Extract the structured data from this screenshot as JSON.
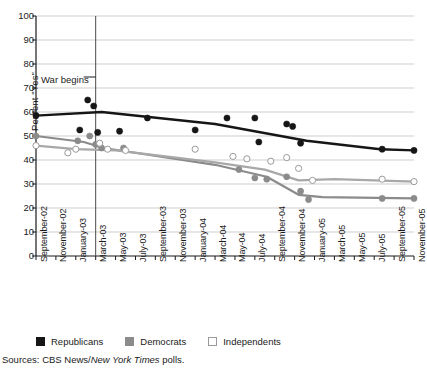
{
  "chart_data": {
    "type": "line",
    "title": "",
    "xlabel": "",
    "ylabel": "Percent \"Yes\"",
    "ylim": [
      0,
      100
    ],
    "yticks": [
      0,
      10,
      20,
      30,
      40,
      50,
      60,
      70,
      80,
      90,
      100
    ],
    "grid": true,
    "legend_position": "below-axis",
    "categories": [
      "September-02",
      "November-02",
      "January-03",
      "March-03",
      "May-03",
      "July-03",
      "September-03",
      "November-03",
      "January-04",
      "March-04",
      "May-04",
      "July-04",
      "September-04",
      "November-04",
      "January-05",
      "March-05",
      "May-05",
      "July-05",
      "September-05",
      "November-05"
    ],
    "annotations": [
      {
        "text": "War begins",
        "x_category": "March-03",
        "type": "vertical-rule"
      }
    ],
    "series": [
      {
        "name": "Republicans",
        "color": "#161616",
        "marker": "filled-circle",
        "trend": [
          {
            "x": 0.0,
            "y": 58.5
          },
          {
            "x": 3.3,
            "y": 60.0
          },
          {
            "x": 9.0,
            "y": 55.0
          },
          {
            "x": 13.6,
            "y": 48.0
          },
          {
            "x": 17.3,
            "y": 44.5
          },
          {
            "x": 19.0,
            "y": 44.0
          }
        ],
        "points": [
          {
            "x": 0.0,
            "y": 58.5
          },
          {
            "x": 2.6,
            "y": 65.0
          },
          {
            "x": 2.9,
            "y": 62.5
          },
          {
            "x": 2.2,
            "y": 52.5
          },
          {
            "x": 3.1,
            "y": 51.5
          },
          {
            "x": 4.2,
            "y": 52.0
          },
          {
            "x": 5.6,
            "y": 57.5
          },
          {
            "x": 8.0,
            "y": 52.5
          },
          {
            "x": 9.6,
            "y": 57.5
          },
          {
            "x": 11.0,
            "y": 57.5
          },
          {
            "x": 12.6,
            "y": 55.0
          },
          {
            "x": 12.9,
            "y": 54.0
          },
          {
            "x": 11.2,
            "y": 47.5
          },
          {
            "x": 13.3,
            "y": 47.0
          },
          {
            "x": 17.4,
            "y": 44.5
          },
          {
            "x": 19.0,
            "y": 44.0
          }
        ]
      },
      {
        "name": "Democrats",
        "color": "#8b8b8b",
        "marker": "filled-circle",
        "trend": [
          {
            "x": 0.0,
            "y": 50.0
          },
          {
            "x": 2.4,
            "y": 47.5
          },
          {
            "x": 3.4,
            "y": 45.0
          },
          {
            "x": 9.0,
            "y": 38.0
          },
          {
            "x": 11.6,
            "y": 33.0
          },
          {
            "x": 13.2,
            "y": 25.5
          },
          {
            "x": 14.4,
            "y": 24.5
          },
          {
            "x": 19.0,
            "y": 24.0
          }
        ],
        "points": [
          {
            "x": 0.0,
            "y": 50.0
          },
          {
            "x": 2.1,
            "y": 48.0
          },
          {
            "x": 2.7,
            "y": 50.0
          },
          {
            "x": 3.0,
            "y": 46.5
          },
          {
            "x": 3.3,
            "y": 45.0
          },
          {
            "x": 4.4,
            "y": 45.0
          },
          {
            "x": 10.2,
            "y": 36.0
          },
          {
            "x": 11.0,
            "y": 32.5
          },
          {
            "x": 11.6,
            "y": 32.0
          },
          {
            "x": 12.6,
            "y": 33.0
          },
          {
            "x": 13.3,
            "y": 27.0
          },
          {
            "x": 13.7,
            "y": 23.5
          },
          {
            "x": 17.4,
            "y": 24.0
          },
          {
            "x": 19.0,
            "y": 24.0
          }
        ]
      },
      {
        "name": "Independents",
        "color": "#ffffff",
        "stroke": "#9a9a9a",
        "marker": "open-circle",
        "trend": [
          {
            "x": 0.0,
            "y": 46.0
          },
          {
            "x": 2.0,
            "y": 44.5
          },
          {
            "x": 4.0,
            "y": 44.0
          },
          {
            "x": 9.0,
            "y": 39.0
          },
          {
            "x": 11.5,
            "y": 36.0
          },
          {
            "x": 13.2,
            "y": 31.5
          },
          {
            "x": 15.0,
            "y": 32.0
          },
          {
            "x": 19.0,
            "y": 31.0
          }
        ],
        "points": [
          {
            "x": 0.0,
            "y": 46.0
          },
          {
            "x": 1.6,
            "y": 43.0
          },
          {
            "x": 2.0,
            "y": 44.5
          },
          {
            "x": 3.2,
            "y": 47.0
          },
          {
            "x": 3.6,
            "y": 44.5
          },
          {
            "x": 4.5,
            "y": 44.0
          },
          {
            "x": 8.0,
            "y": 44.5
          },
          {
            "x": 9.9,
            "y": 41.5
          },
          {
            "x": 10.6,
            "y": 40.5
          },
          {
            "x": 11.8,
            "y": 39.5
          },
          {
            "x": 12.6,
            "y": 41.0
          },
          {
            "x": 13.2,
            "y": 36.5
          },
          {
            "x": 13.9,
            "y": 31.5
          },
          {
            "x": 17.4,
            "y": 32.0
          },
          {
            "x": 19.0,
            "y": 31.0
          }
        ]
      }
    ]
  },
  "legend": {
    "items": [
      {
        "label": "Republicans",
        "swatch": "filled-black-square"
      },
      {
        "label": "Democrats",
        "swatch": "filled-gray-square"
      },
      {
        "label": "Independents",
        "swatch": "open-white-square"
      }
    ]
  },
  "source": {
    "prefix": "Sources: CBS News/",
    "italic": "New York Times",
    "suffix": " polls."
  }
}
